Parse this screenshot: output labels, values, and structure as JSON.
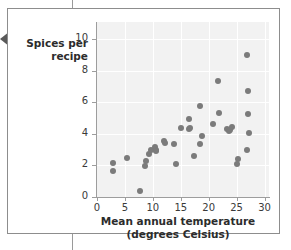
{
  "page": {
    "nav_prev_icon": "triangle-left-icon"
  },
  "chart_data": {
    "type": "scatter",
    "title": "",
    "xlabel": "Mean annual temperature",
    "xlabel_line2": "(degrees Celsius)",
    "ylabel": "Spices per",
    "ylabel_line2": "recipe",
    "xlim": [
      0,
      30.8
    ],
    "ylim": [
      0,
      11.1
    ],
    "xticks": [
      0,
      5,
      10,
      15,
      20,
      25,
      30
    ],
    "yticks": [
      0,
      2,
      4,
      6,
      8,
      10
    ],
    "xtick_labels": [
      "0",
      "5",
      "10",
      "15",
      "20",
      "25",
      "30"
    ],
    "ytick_labels": [
      "0",
      "2",
      "4",
      "6",
      "8",
      "10"
    ],
    "grid": true,
    "grid_color": "#ffffff",
    "plot_background": "#f2f2f2",
    "marker_color": "#7b7b7b",
    "marker_size": 6,
    "legend": null,
    "points": [
      {
        "x": 2.8,
        "y": 1.65
      },
      {
        "x": 2.9,
        "y": 2.15
      },
      {
        "x": 5.4,
        "y": 2.5
      },
      {
        "x": 7.7,
        "y": 0.35
      },
      {
        "x": 8.6,
        "y": 1.95
      },
      {
        "x": 8.7,
        "y": 2.3
      },
      {
        "x": 9.4,
        "y": 2.75
      },
      {
        "x": 9.6,
        "y": 3.0
      },
      {
        "x": 10.3,
        "y": 3.2
      },
      {
        "x": 10.5,
        "y": 3.0
      },
      {
        "x": 10.6,
        "y": 2.9
      },
      {
        "x": 12.0,
        "y": 3.55
      },
      {
        "x": 12.2,
        "y": 3.4
      },
      {
        "x": 13.7,
        "y": 3.35
      },
      {
        "x": 14.2,
        "y": 2.1
      },
      {
        "x": 15.0,
        "y": 4.4
      },
      {
        "x": 16.4,
        "y": 4.95
      },
      {
        "x": 16.5,
        "y": 4.3
      },
      {
        "x": 16.7,
        "y": 4.35
      },
      {
        "x": 17.3,
        "y": 2.6
      },
      {
        "x": 18.5,
        "y": 5.75
      },
      {
        "x": 18.4,
        "y": 3.35
      },
      {
        "x": 18.8,
        "y": 3.85
      },
      {
        "x": 20.7,
        "y": 4.6
      },
      {
        "x": 21.6,
        "y": 7.35
      },
      {
        "x": 21.9,
        "y": 5.3
      },
      {
        "x": 23.3,
        "y": 4.3
      },
      {
        "x": 23.6,
        "y": 4.2
      },
      {
        "x": 23.9,
        "y": 4.25
      },
      {
        "x": 24.1,
        "y": 4.45
      },
      {
        "x": 25.1,
        "y": 2.1
      },
      {
        "x": 25.2,
        "y": 2.4
      },
      {
        "x": 26.9,
        "y": 9.0
      },
      {
        "x": 27.0,
        "y": 6.7
      },
      {
        "x": 27.1,
        "y": 5.25
      },
      {
        "x": 27.3,
        "y": 4.05
      },
      {
        "x": 26.9,
        "y": 2.95
      }
    ]
  }
}
